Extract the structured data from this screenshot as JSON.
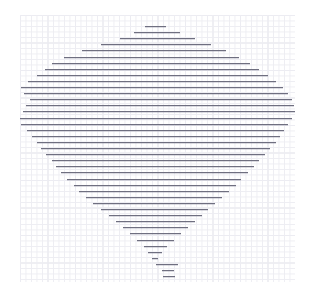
{
  "chart_data": {
    "type": "bar",
    "title": "",
    "subtitle": "",
    "xlabel": "",
    "ylabel": "",
    "xlim": [
      0,
      100
    ],
    "ylim": [
      0,
      42
    ],
    "grid": true,
    "grid_minor_spacing": 1,
    "grid_major_spacing": 5,
    "legend": "none",
    "orientation": "horizontal",
    "style": "range-bars-on-graph-paper",
    "axis_ticks_visible": false,
    "tick_labels_visible": false,
    "categories": [
      "r01",
      "r02",
      "r03",
      "r04",
      "r05",
      "r06",
      "r07",
      "r08",
      "r09",
      "r10",
      "r11",
      "r12",
      "r13",
      "r14",
      "r15",
      "r16",
      "r17",
      "r18",
      "r19",
      "r20",
      "r21",
      "r22",
      "r23",
      "r24",
      "r25",
      "r26",
      "r27",
      "r28",
      "r29",
      "r30",
      "r31",
      "r32",
      "r33",
      "r34",
      "r35",
      "r36",
      "r37",
      "r38",
      "r39",
      "r40",
      "r41",
      "r42"
    ],
    "series": [
      {
        "name": "range-start",
        "values": [
          45.5,
          41.5,
          36.5,
          29.5,
          22.5,
          16.0,
          11.5,
          9.0,
          6.0,
          3.0,
          0.5,
          1.5,
          3.5,
          2.0,
          1.0,
          0.0,
          0.5,
          2.5,
          4.5,
          6.0,
          7.5,
          9.5,
          11.5,
          13.0,
          15.0,
          17.0,
          19.5,
          21.5,
          24.0,
          26.5,
          29.5,
          32.5,
          35.0,
          37.5,
          40.0,
          42.5,
          45.0,
          46.5,
          48.0,
          49.5,
          51.5,
          52.0
        ]
      },
      {
        "name": "range-end",
        "values": [
          53.0,
          58.0,
          63.5,
          69.5,
          75.0,
          79.5,
          83.5,
          87.0,
          90.0,
          93.0,
          95.5,
          97.5,
          99.0,
          99.5,
          100.0,
          99.0,
          97.5,
          96.0,
          94.5,
          93.0,
          91.0,
          89.0,
          87.0,
          85.0,
          83.0,
          80.5,
          78.5,
          76.0,
          73.5,
          71.0,
          68.5,
          66.0,
          63.5,
          61.0,
          58.5,
          56.0,
          53.5,
          51.5,
          50.0,
          57.5,
          56.0,
          56.5
        ]
      }
    ],
    "annotations": []
  },
  "colors": {
    "bar": "#6f6f80",
    "grid_minor": "#ededf2",
    "grid_major": "#e0e0e8",
    "background": "#ffffff"
  },
  "plot_geometry": {
    "left_px": 20,
    "top_px": 15,
    "width_px": 275,
    "height_px": 267,
    "row_pitch_px": 6.1,
    "first_row_y_px": 26
  }
}
